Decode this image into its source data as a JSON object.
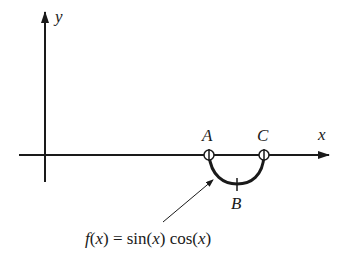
{
  "diagram": {
    "axes": {
      "x_label": "x",
      "y_label": "y"
    },
    "points": [
      {
        "id": "A",
        "label": "A",
        "marker": "open-circle"
      },
      {
        "id": "B",
        "label": "B",
        "marker": "tick"
      },
      {
        "id": "C",
        "label": "C",
        "marker": "open-circle"
      }
    ],
    "curve": {
      "description": "semicircular arc below x-axis from A to C through B"
    },
    "annotation": {
      "f": "f",
      "open1": "(",
      "x1": "x",
      "close1": ")",
      "eq": " = sin(",
      "x2": "x",
      "mid": ") cos(",
      "x3": "x",
      "close3": ")"
    },
    "colors": {
      "stroke": "#1a1a1a",
      "background": "#ffffff"
    }
  }
}
